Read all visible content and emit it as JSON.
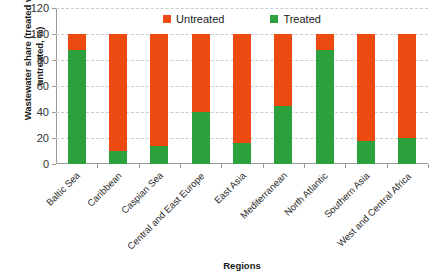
{
  "chart_data": {
    "type": "bar",
    "subtype": "stacked-100-percent",
    "title": "",
    "xlabel": "Regions",
    "ylabel": "Wastewater share (treated vs untreated, %)",
    "ylim": [
      0,
      120
    ],
    "yticks": [
      0,
      20,
      40,
      60,
      80,
      100,
      120
    ],
    "grid": true,
    "legend_position": "top-center",
    "categories": [
      "Baltic Sea",
      "Caribbean",
      "Caspian Sea",
      "Central and East Europe",
      "East Asia",
      "Mediterranean",
      "North Atlantic",
      "Southern Asia",
      "West and Central Africa"
    ],
    "series": [
      {
        "name": "Treated",
        "color": "#2CA03C",
        "values": [
          88,
          10,
          14,
          40,
          16,
          45,
          88,
          18,
          20
        ]
      },
      {
        "name": "Untreated",
        "color": "#ED4A12",
        "values": [
          12,
          90,
          86,
          60,
          84,
          55,
          12,
          82,
          80
        ]
      }
    ]
  },
  "legend": {
    "items": [
      {
        "label": "Untreated",
        "color": "#ED4A12",
        "icon": "square-swatch-icon"
      },
      {
        "label": "Treated",
        "color": "#2CA03C",
        "icon": "square-swatch-icon"
      }
    ]
  },
  "axes": {
    "y_title": "Wastewater share (treated vs untreated, %)",
    "x_title": "Regions",
    "y_tick_labels": [
      "0",
      "20",
      "40",
      "60",
      "80",
      "100",
      "120"
    ]
  }
}
